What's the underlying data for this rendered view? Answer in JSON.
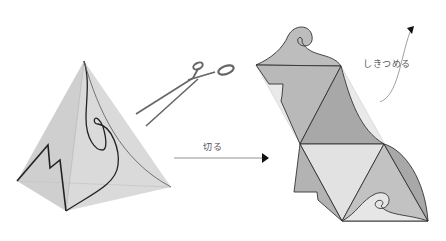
{
  "labels": {
    "cut": "切る",
    "fold": "しきつめる"
  },
  "figures": {
    "left": "tetrahedron-with-cut-lines",
    "middle": "scissors-icon",
    "right": "unfolded-net-tiling"
  },
  "colors": {
    "background": "#ffffff",
    "face_light": "#dcdcdc",
    "face_mid": "#cfcfcf",
    "face_dark": "#c4c4c4",
    "net_dark": "#a8a8a8",
    "net_mid": "#bdbdbd",
    "net_light": "#e2e2e2",
    "net_lightest": "#ececec",
    "outline": "#333333",
    "arrow": "#555555"
  }
}
